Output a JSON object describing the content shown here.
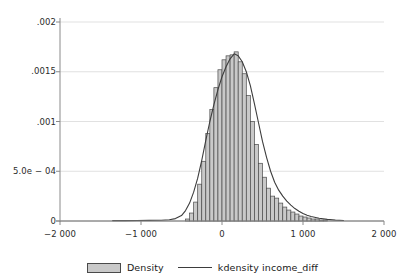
{
  "chart_data": {
    "type": "bar",
    "title": "",
    "subtitle": "",
    "xlabel": "",
    "ylabel": "",
    "xlim": [
      -2000,
      2000
    ],
    "ylim": [
      0,
      0.002
    ],
    "grid": "horizontal",
    "legend_position": "bottom",
    "x_ticks": [
      -2000,
      -1000,
      0,
      1000,
      2000
    ],
    "x_tick_labels": [
      "−2 000",
      "−1 000",
      "0",
      "1 000",
      "2 000"
    ],
    "y_ticks": [
      0,
      0.0005,
      0.001,
      0.0015,
      0.002
    ],
    "y_tick_labels": [
      "0",
      "5.0e − 04",
      ".001",
      ".0015",
      ".002"
    ],
    "series": [
      {
        "name": "Density",
        "type": "histogram",
        "bin_width": 50,
        "bin_centers": [
          -425,
          -375,
          -325,
          -275,
          -225,
          -175,
          -125,
          -75,
          -25,
          25,
          75,
          125,
          175,
          225,
          275,
          325,
          375,
          425,
          475,
          525,
          575,
          625,
          675,
          725,
          775,
          825,
          875,
          925,
          975,
          1025,
          1075,
          1125,
          1175,
          1225,
          1275,
          1325
        ],
        "values": [
          2e-05,
          8e-05,
          0.00019,
          0.00037,
          0.0006,
          0.00088,
          0.00112,
          0.00134,
          0.00152,
          0.00162,
          0.00166,
          0.00167,
          0.0017,
          0.0016,
          0.00148,
          0.00126,
          0.001,
          0.00077,
          0.00058,
          0.00044,
          0.00033,
          0.00025,
          0.00023,
          0.00018,
          0.00014,
          0.00011,
          9e-05,
          7e-05,
          5e-05,
          4e-05,
          3e-05,
          2e-05,
          2e-05,
          1e-05,
          1e-05,
          0.0
        ]
      },
      {
        "name": "kdensity income_diff",
        "type": "line",
        "x": [
          -1350,
          -1200,
          -1050,
          -900,
          -750,
          -650,
          -575,
          -500,
          -450,
          -400,
          -350,
          -300,
          -250,
          -200,
          -150,
          -100,
          -50,
          0,
          50,
          100,
          150,
          200,
          250,
          300,
          350,
          400,
          450,
          500,
          550,
          600,
          650,
          700,
          750,
          800,
          850,
          900,
          950,
          1000,
          1050,
          1100,
          1200,
          1300,
          1400,
          1500
        ],
        "y": [
          4e-06,
          4e-06,
          5e-06,
          6e-06,
          8e-06,
          1.2e-05,
          2.4e-05,
          5.5e-05,
          0.000105,
          0.00018,
          0.00029,
          0.00043,
          0.00061,
          0.00081,
          0.001,
          0.00117,
          0.00132,
          0.00145,
          0.00155,
          0.00163,
          0.00168,
          0.00166,
          0.0016,
          0.0015,
          0.00136,
          0.00118,
          0.00099,
          0.0008,
          0.00064,
          0.0005,
          0.00039,
          0.00031,
          0.00025,
          0.0002,
          0.00016,
          0.000125,
          9.8e-05,
          7.6e-05,
          5.8e-05,
          4.5e-05,
          2.7e-05,
          1.6e-05,
          9e-06,
          5e-06
        ]
      }
    ]
  },
  "axes": {
    "y_tick_labels": [
      "​.002",
      ".0015",
      ".001",
      "5.0e − 04",
      "0"
    ],
    "x_tick_labels": [
      "−2 000",
      "−1 000",
      "0",
      "1 000",
      "2 000"
    ]
  },
  "legend": {
    "items": [
      {
        "label": "Density",
        "marker": "filled-rect",
        "color": "#c9c9c9"
      },
      {
        "label": "kdensity income_diff",
        "marker": "line",
        "color": "#3d3d3d"
      }
    ]
  },
  "colors": {
    "background": "#ffffff",
    "grid": "#d9d9d9",
    "axis": "#8a8a8a",
    "bar_fill": "#c9c9c9",
    "bar_stroke": "#4a4a4a",
    "kdensity_line": "#3d3d3d",
    "text": "#1a1a1a"
  }
}
